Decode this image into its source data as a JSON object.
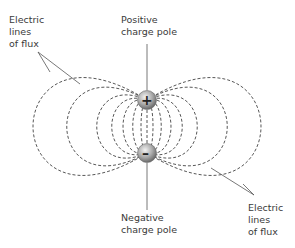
{
  "labels": {
    "top_left": "Electric\nlines\nof flux",
    "top_center": "Positive\ncharge pole",
    "bottom_center": "Negative\ncharge pole",
    "bottom_right": "Electric\nlines\nof flux"
  },
  "poles": {
    "positive_symbol": "+",
    "negative_symbol": "–"
  },
  "colors": {
    "line": "#444444",
    "pole_fill": "#9a9a9a"
  }
}
